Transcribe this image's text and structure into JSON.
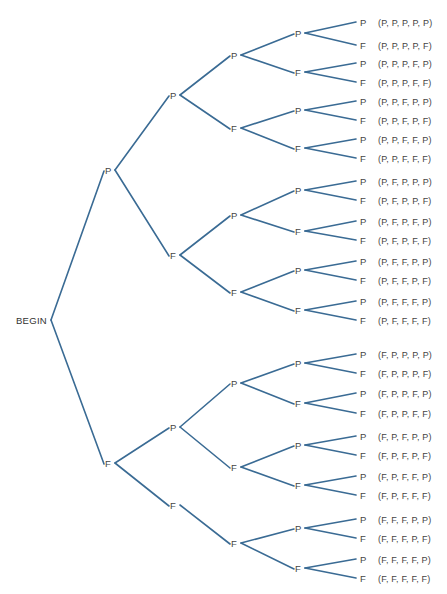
{
  "diagram": {
    "type": "probability-tree",
    "root": {
      "label": "BEGIN",
      "x": 50,
      "y": 320
    },
    "colors": {
      "edge": "#3a6b94",
      "text": "#444444",
      "background": "#ffffff"
    },
    "nodes": [
      {
        "id": "P",
        "label": "P",
        "x": 107,
        "y": 170,
        "parent": "root"
      },
      {
        "id": "F",
        "label": "F",
        "x": 107,
        "y": 463,
        "parent": "root"
      },
      {
        "id": "PP",
        "label": "P",
        "x": 172,
        "y": 95,
        "parent": "P"
      },
      {
        "id": "PF",
        "label": "F",
        "x": 172,
        "y": 255,
        "parent": "P"
      },
      {
        "id": "FP",
        "label": "P",
        "x": 172,
        "y": 427,
        "parent": "F"
      },
      {
        "id": "FF",
        "label": "F",
        "x": 172,
        "y": 505,
        "parent": "F"
      },
      {
        "id": "PPP",
        "label": "P",
        "x": 233,
        "y": 55,
        "parent": "PP"
      },
      {
        "id": "PPF",
        "label": "F",
        "x": 233,
        "y": 128,
        "parent": "PP"
      },
      {
        "id": "PFP",
        "label": "P",
        "x": 233,
        "y": 215,
        "parent": "PF"
      },
      {
        "id": "PFF",
        "label": "F",
        "x": 233,
        "y": 292,
        "parent": "PF"
      },
      {
        "id": "FPP",
        "label": "P",
        "x": 233,
        "y": 383,
        "parent": "FP"
      },
      {
        "id": "FPF",
        "label": "F",
        "x": 233,
        "y": 467,
        "parent": "FP"
      },
      {
        "id": "FFF",
        "label": "F",
        "x": 233,
        "y": 543,
        "parent": "FF"
      },
      {
        "id": "PPPP",
        "label": "P",
        "x": 297,
        "y": 33,
        "parent": "PPP"
      },
      {
        "id": "PPPF",
        "label": "F",
        "x": 297,
        "y": 72,
        "parent": "PPP"
      },
      {
        "id": "PPFP",
        "label": "P",
        "x": 297,
        "y": 110,
        "parent": "PPF"
      },
      {
        "id": "PPFF",
        "label": "F",
        "x": 297,
        "y": 148,
        "parent": "PPF"
      },
      {
        "id": "PFPP",
        "label": "P",
        "x": 297,
        "y": 190,
        "parent": "PFP"
      },
      {
        "id": "PFPF",
        "label": "F",
        "x": 297,
        "y": 231,
        "parent": "PFP"
      },
      {
        "id": "PFFP",
        "label": "P",
        "x": 297,
        "y": 270,
        "parent": "PFF"
      },
      {
        "id": "PFFF",
        "label": "F",
        "x": 297,
        "y": 310,
        "parent": "PFF"
      },
      {
        "id": "FPPP",
        "label": "P",
        "x": 297,
        "y": 363,
        "parent": "FPP"
      },
      {
        "id": "FPPF",
        "label": "F",
        "x": 297,
        "y": 403,
        "parent": "FPP"
      },
      {
        "id": "FPFP",
        "label": "P",
        "x": 297,
        "y": 445,
        "parent": "FPF"
      },
      {
        "id": "FPFF",
        "label": "F",
        "x": 297,
        "y": 485,
        "parent": "FPF"
      },
      {
        "id": "FFFP",
        "label": "P",
        "x": 297,
        "y": 528,
        "parent": "FFF"
      },
      {
        "id": "FFFF",
        "label": "F",
        "x": 297,
        "y": 568,
        "parent": "FFF"
      }
    ],
    "leaves": [
      {
        "label": "P",
        "y": 22,
        "parent": "PPPP",
        "outcome": "(P, P, P, P, P)"
      },
      {
        "label": "F",
        "y": 45,
        "parent": "PPPP",
        "outcome": "(P, P, P, P, F)"
      },
      {
        "label": "P",
        "y": 63,
        "parent": "PPPF",
        "outcome": "(P, P, P, F, P)"
      },
      {
        "label": "F",
        "y": 82,
        "parent": "PPPF",
        "outcome": "(P, P, P, F, F)"
      },
      {
        "label": "P",
        "y": 101,
        "parent": "PPFP",
        "outcome": "(P, P, F, P, P)"
      },
      {
        "label": "F",
        "y": 120,
        "parent": "PPFP",
        "outcome": "(P, P, F, P, F)"
      },
      {
        "label": "P",
        "y": 139,
        "parent": "PPFF",
        "outcome": "(P, P, F, F, P)"
      },
      {
        "label": "F",
        "y": 158,
        "parent": "PPFF",
        "outcome": "(P, P, F, F, F)"
      },
      {
        "label": "P",
        "y": 181,
        "parent": "PFPP",
        "outcome": "(P, F, P, P, P)"
      },
      {
        "label": "F",
        "y": 200,
        "parent": "PFPP",
        "outcome": "(P, F, P, P, F)"
      },
      {
        "label": "P",
        "y": 221,
        "parent": "PFPF",
        "outcome": "(P, F, P, F, P)"
      },
      {
        "label": "F",
        "y": 240,
        "parent": "PFPF",
        "outcome": "(P, F, P, F, F)"
      },
      {
        "label": "P",
        "y": 261,
        "parent": "PFFP",
        "outcome": "(P, F, F, P, P)"
      },
      {
        "label": "F",
        "y": 280,
        "parent": "PFFP",
        "outcome": "(P, F, F, P, F)"
      },
      {
        "label": "P",
        "y": 301,
        "parent": "PFFF",
        "outcome": "(P, F, F, F, P)"
      },
      {
        "label": "F",
        "y": 320,
        "parent": "PFFF",
        "outcome": "(P, F, F, F, F)"
      },
      {
        "label": "P",
        "y": 354,
        "parent": "FPPP",
        "outcome": "(F, P, P, P, P)"
      },
      {
        "label": "F",
        "y": 373,
        "parent": "FPPP",
        "outcome": "(F, P, P, P, F)"
      },
      {
        "label": "P",
        "y": 393,
        "parent": "FPPF",
        "outcome": "(F, P, P, F, P)"
      },
      {
        "label": "F",
        "y": 413,
        "parent": "FPPF",
        "outcome": "(F, P, P, F, F)"
      },
      {
        "label": "P",
        "y": 436,
        "parent": "FPFP",
        "outcome": "(F, P, F, P, P)"
      },
      {
        "label": "F",
        "y": 455,
        "parent": "FPFP",
        "outcome": "(F, P, F, P, F)"
      },
      {
        "label": "P",
        "y": 476,
        "parent": "FPFF",
        "outcome": "(F, P, F, F, P)"
      },
      {
        "label": "F",
        "y": 495,
        "parent": "FPFF",
        "outcome": "(F, P, F, F, F)"
      },
      {
        "label": "P",
        "y": 519,
        "parent": "FFFP",
        "outcome": "(F, F, F, P, P)"
      },
      {
        "label": "F",
        "y": 538,
        "parent": "FFFP",
        "outcome": "(F, F, F, P, F)"
      },
      {
        "label": "P",
        "y": 559,
        "parent": "FFFF",
        "outcome": "(F, F, F, F, P)"
      },
      {
        "label": "F",
        "y": 578,
        "parent": "FFFF",
        "outcome": "(F, F, F, F, F)"
      }
    ],
    "leaf_x": 360,
    "outcome_x": 378
  }
}
